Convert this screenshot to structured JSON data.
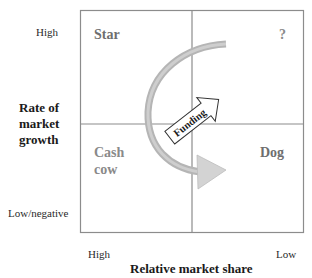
{
  "diagram": {
    "y_axis": {
      "title": "Rate of market growth",
      "title_lines": [
        "Rate of",
        "market",
        "growth"
      ],
      "tick_high": "High",
      "tick_low": "Low/negative"
    },
    "x_axis": {
      "title": "Relative market share",
      "tick_high": "High",
      "tick_low": "Low"
    },
    "quadrants": {
      "top_left": {
        "label": "Star"
      },
      "top_right": {
        "label": "?"
      },
      "bottom_left": {
        "label_lines": [
          "Cash",
          "cow"
        ],
        "label": "Cash cow"
      },
      "bottom_right": {
        "label": "Dog"
      }
    },
    "arrows": {
      "funding": {
        "label": "Funding",
        "direction": "Cash cow to question mark"
      },
      "cycle": {
        "description": "Curved arrow from question mark through star to dog"
      }
    },
    "colors": {
      "grid_line": "#8c8c8c",
      "arc_fill": "#b8b8b8",
      "arrowhead_fill": "#d4d4d4",
      "quadrant_label": "#8a8a8a",
      "axis_text": "#1a1a1a"
    }
  }
}
